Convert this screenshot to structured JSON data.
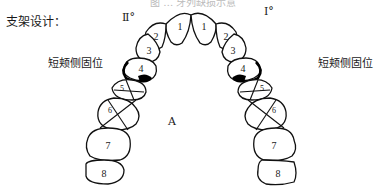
{
  "caption_cut": "图 … 牙列缺损示意",
  "title": "支架设计：",
  "classes": {
    "left": "Ⅱ°",
    "right": "Ⅰ°"
  },
  "annotations": {
    "left_clasp": "短颊侧固位",
    "right_clasp": "短颊侧固位"
  },
  "side_labels": {
    "left": "A",
    "right": "B"
  },
  "teeth": {
    "left": [
      "1",
      "2",
      "3",
      "4",
      "5",
      "6",
      "7",
      "8"
    ],
    "right": [
      "1",
      "2",
      "3",
      "4",
      "5",
      "6",
      "7",
      "8"
    ]
  },
  "colors": {
    "line": "#111111",
    "text": "#1a1a1a",
    "background": "#ffffff"
  }
}
